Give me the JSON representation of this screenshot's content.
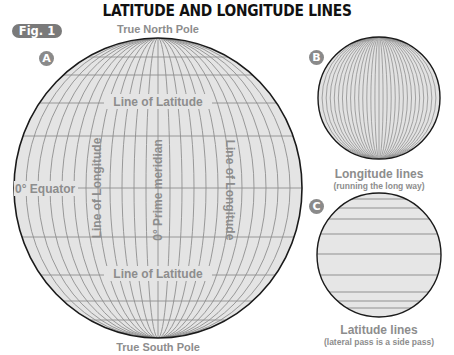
{
  "title": "LATITUDE AND LONGITUDE LINES",
  "figure_label": "Fig. 1",
  "colors": {
    "globe_fill": "#e4e4e4",
    "grid_line": "#8f8f8f",
    "outline": "#1a1a1a",
    "label_text": "#8d8d8d",
    "badge_bg": "#8a8a8a"
  },
  "globe_a": {
    "badge": "A",
    "north_pole_label": "True North Pole",
    "south_pole_label": "True South Pole",
    "equator_label": "0° Equator",
    "latitude_label_top": "Line of Latitude",
    "latitude_label_bottom": "Line of Latitude",
    "longitude_label_left": "Line of Longitude",
    "longitude_label_right": "Line of Longitude",
    "prime_meridian_label": "0° Prime meridian"
  },
  "globe_b": {
    "badge": "B",
    "caption": "Longitude lines",
    "subcaption": "(running the long way)"
  },
  "globe_c": {
    "badge": "C",
    "caption": "Latitude lines",
    "subcaption": "(lateral pass is a side pass)"
  }
}
